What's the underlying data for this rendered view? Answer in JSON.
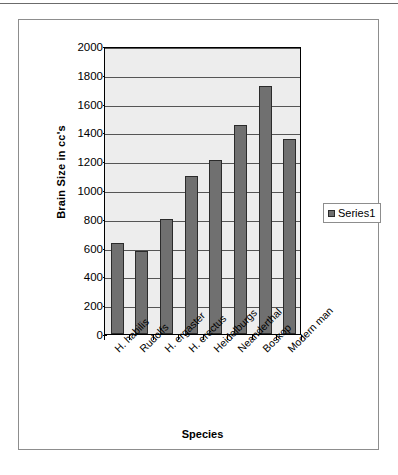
{
  "chart_data": {
    "type": "bar",
    "title": "",
    "xlabel": "Species",
    "ylabel": "Brain Size in cc's",
    "categories": [
      "H. habilis",
      "Rudolfs",
      "H. ergaster",
      "H. erectus",
      "Heidelburgs",
      "Neanderthal",
      "Boskop",
      "Modern man"
    ],
    "series": [
      {
        "name": "Series1",
        "values": [
          630,
          575,
          800,
          1100,
          1205,
          1450,
          1720,
          1355
        ]
      }
    ],
    "ylim": [
      0,
      2000
    ],
    "yticks": [
      0,
      200,
      400,
      600,
      800,
      1000,
      1200,
      1400,
      1600,
      1800,
      2000
    ],
    "ytick_labels": [
      "0",
      "200",
      "400",
      "600",
      "800",
      "1000",
      "1200",
      "1400",
      "1600",
      "1800",
      "2000"
    ],
    "grid": true,
    "legend_position": "right",
    "colors": {
      "bar_fill": "#707070",
      "bar_border": "#2b2b2b",
      "plot_background": "#ededed",
      "gridline": "#555555",
      "axis": "#000000",
      "frame_border": "#8d8d8d"
    }
  },
  "legend": {
    "entries": [
      {
        "label": "Series1",
        "marker": "square-swatch"
      }
    ]
  },
  "axes": {
    "y_title": "Brain Size in cc's",
    "x_title": "Species"
  }
}
